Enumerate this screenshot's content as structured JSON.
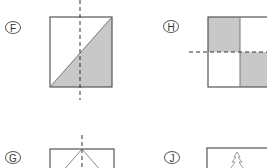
{
  "figures": [
    {
      "id": "F",
      "label": "F",
      "description": "square divided by diagonal, lower-right triangle shaded, vertical dashed line"
    },
    {
      "id": "H",
      "label": "H",
      "description": "rectangle in four quadrants, top-left and bottom-right shaded, horizontal dashed line"
    },
    {
      "id": "G",
      "label": "G",
      "description": "rectangle with lines from top center, vertical dashed line"
    },
    {
      "id": "J",
      "label": "J",
      "description": "rectangle containing a tree outline"
    }
  ],
  "colors": {
    "stroke": "#555555",
    "shade": "#c8c8c8",
    "dash": "#333333"
  }
}
